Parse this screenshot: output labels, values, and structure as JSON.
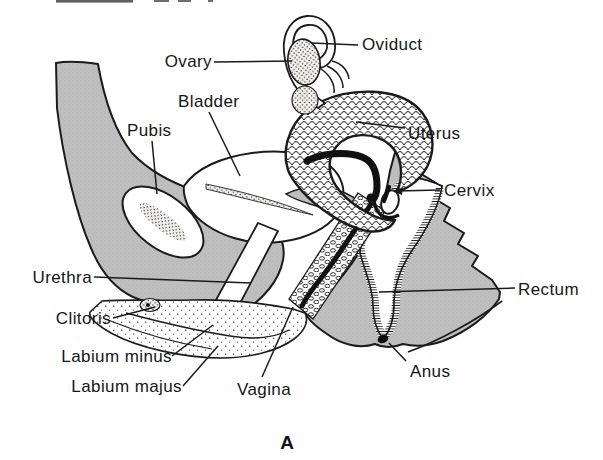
{
  "figure": {
    "panel_letter": "A",
    "labels": {
      "oviduct": "Oviduct",
      "ovary": "Ovary",
      "bladder": "Bladder",
      "pubis": "Pubis",
      "uterus": "Uterus",
      "cervix": "Cervix",
      "urethra": "Urethra",
      "clitoris": "Clitoris",
      "labium_minus": "Labium minus",
      "labium_majus": "Labium majus",
      "vagina": "Vagina",
      "rectum": "Rectum",
      "anus": "Anus"
    },
    "colors": {
      "ink": "#1b1b1b",
      "tissue_gray": "#bdbdbd",
      "paper": "#ffffff"
    }
  }
}
